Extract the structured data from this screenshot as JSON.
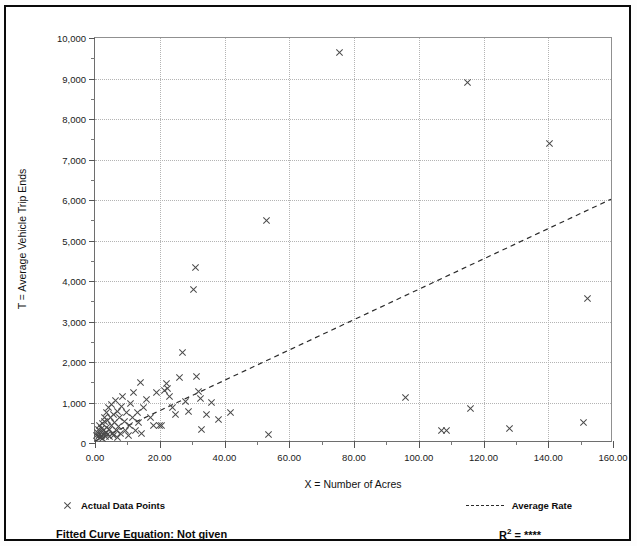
{
  "figure": {
    "partial_title_fragment": "",
    "background": "#ffffff",
    "border_color": "#0a0a0a"
  },
  "chart_data": {
    "type": "scatter",
    "title": "",
    "xlabel": "X = Number of Acres",
    "ylabel": "T = Average Vehicle Trip Ends",
    "xlim": [
      0,
      160
    ],
    "ylim": [
      0,
      10000
    ],
    "xticks": [
      0,
      20,
      40,
      60,
      80,
      100,
      120,
      140,
      160
    ],
    "xtick_labels": [
      "0.00",
      "20.00",
      "40.00",
      "60.00",
      "80.00",
      "100.00",
      "120.00",
      "140.00",
      "160.00"
    ],
    "yticks": [
      0,
      1000,
      2000,
      3000,
      4000,
      5000,
      6000,
      7000,
      8000,
      9000,
      10000
    ],
    "ytick_labels": [
      "0",
      "1,000",
      "2,000",
      "3,000",
      "4,000",
      "5,000",
      "6,000",
      "7,000",
      "8,000",
      "9,000",
      "10,000"
    ],
    "x_minor_interval": 10,
    "y_minor_interval": 500,
    "grid": true,
    "grid_style": "dotted",
    "grid_color": "#b4b4b4",
    "marker_symbol": "x",
    "marker_color": "#4a4a4a",
    "legend_position": "below-axes-split",
    "series": [
      {
        "name": "Actual Data Points",
        "type": "scatter",
        "points": [
          [
            0.6,
            180
          ],
          [
            0.8,
            250
          ],
          [
            1.0,
            150
          ],
          [
            1.1,
            330
          ],
          [
            1.3,
            210
          ],
          [
            1.5,
            420
          ],
          [
            1.6,
            140
          ],
          [
            1.8,
            280
          ],
          [
            2.0,
            360
          ],
          [
            2.1,
            190
          ],
          [
            2.3,
            470
          ],
          [
            2.4,
            120
          ],
          [
            2.6,
            300
          ],
          [
            2.8,
            520
          ],
          [
            2.9,
            230
          ],
          [
            3.0,
            640
          ],
          [
            3.2,
            170
          ],
          [
            3.4,
            390
          ],
          [
            3.5,
            760
          ],
          [
            3.7,
            260
          ],
          [
            3.9,
            560
          ],
          [
            4.0,
            200
          ],
          [
            4.2,
            880
          ],
          [
            4.4,
            340
          ],
          [
            4.6,
            150
          ],
          [
            4.8,
            620
          ],
          [
            5.0,
            430
          ],
          [
            5.2,
            950
          ],
          [
            5.4,
            240
          ],
          [
            5.6,
            700
          ],
          [
            5.8,
            180
          ],
          [
            6.0,
            510
          ],
          [
            6.2,
            1060
          ],
          [
            6.5,
            300
          ],
          [
            6.8,
            130
          ],
          [
            7.0,
            790
          ],
          [
            7.3,
            400
          ],
          [
            7.6,
            640
          ],
          [
            8.0,
            230
          ],
          [
            8.3,
            900
          ],
          [
            8.6,
            1150
          ],
          [
            9.0,
            540
          ],
          [
            9.4,
            300
          ],
          [
            9.8,
            760
          ],
          [
            10.2,
            180
          ],
          [
            10.6,
            430
          ],
          [
            11.0,
            980
          ],
          [
            11.5,
            620
          ],
          [
            12.0,
            1240
          ],
          [
            12.5,
            300
          ],
          [
            13.0,
            760
          ],
          [
            13.5,
            500
          ],
          [
            14.0,
            1500
          ],
          [
            14.5,
            240
          ],
          [
            15.0,
            880
          ],
          [
            16.0,
            1080
          ],
          [
            17.0,
            640
          ],
          [
            18.0,
            420
          ],
          [
            19.0,
            1250
          ],
          [
            20.0,
            440
          ],
          [
            20.5,
            420
          ],
          [
            21.5,
            1290
          ],
          [
            22.0,
            1470
          ],
          [
            22.3,
            1340
          ],
          [
            23.0,
            1160
          ],
          [
            24.0,
            870
          ],
          [
            25.0,
            700
          ],
          [
            26.0,
            1620
          ],
          [
            27.0,
            2240
          ],
          [
            28.0,
            1020
          ],
          [
            29.0,
            780
          ],
          [
            30.5,
            3780
          ],
          [
            31.0,
            4330
          ],
          [
            31.5,
            1630
          ],
          [
            32.0,
            1270
          ],
          [
            32.5,
            1090
          ],
          [
            33.0,
            330
          ],
          [
            34.5,
            700
          ],
          [
            36.0,
            1000
          ],
          [
            38.0,
            580
          ],
          [
            42.0,
            760
          ],
          [
            53.0,
            5500
          ],
          [
            53.5,
            210
          ],
          [
            96.0,
            1120
          ],
          [
            107.0,
            320
          ],
          [
            108.5,
            320
          ],
          [
            115.0,
            8900
          ],
          [
            116.0,
            850
          ],
          [
            128.0,
            350
          ],
          [
            140.5,
            7400
          ],
          [
            151.0,
            500
          ],
          [
            152.0,
            3560
          ],
          [
            75.5,
            9650
          ]
        ]
      },
      {
        "name": "Average Rate",
        "type": "line",
        "style": "dashed",
        "color": "#2b2b2b",
        "x": [
          0,
          160
        ],
        "y": [
          0,
          6000
        ],
        "slope": 37.5,
        "intercept": 0
      }
    ],
    "annotations": {
      "fitted_curve_equation_label": "Fitted Curve Equation:",
      "fitted_curve_equation_value": "Not given",
      "r_squared_label": "R",
      "r_squared_exponent": "2",
      "r_squared_equals": "=",
      "r_squared_value": "****"
    }
  },
  "legend": {
    "data_points_label": "Actual Data Points",
    "average_rate_label": "Average Rate"
  },
  "footer": {
    "equation_text": "Fitted Curve Equation:  Not given",
    "r2_text": "R",
    "r2_sup": "2",
    "r2_rest": " = ",
    "r2_value": "****"
  }
}
